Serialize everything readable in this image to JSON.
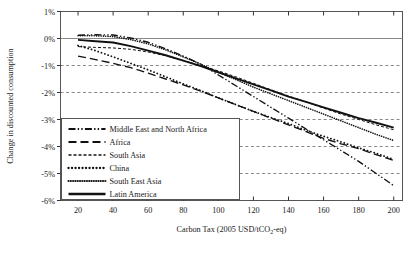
{
  "chart_data": {
    "type": "line",
    "title": "",
    "xlabel": "Carbon Tax (2005 USD/tCO2-eq)",
    "xlabel_parts": {
      "pre": "Carbon Tax (2005 USD/tCO",
      "sub": "2",
      "post": "-eq)"
    },
    "ylabel": "Change in discounted consumption",
    "xlim": [
      10,
      205
    ],
    "ylim": [
      -6,
      1
    ],
    "xticks": [
      20,
      40,
      60,
      80,
      100,
      120,
      140,
      160,
      180,
      200
    ],
    "xtick_labels": [
      "20",
      "40",
      "60",
      "80",
      "100",
      "120",
      "140",
      "160",
      "180",
      "200"
    ],
    "yticks": [
      1,
      0,
      -1,
      -2,
      -3,
      -4,
      -5,
      -6
    ],
    "ytick_labels": [
      "1%",
      "0%",
      "-1%",
      "-2%",
      "-3%",
      "-4%",
      "-5%",
      "-6%"
    ],
    "grid": "horizontal-dashed",
    "legend_position": "lower-left-inside",
    "x": [
      20,
      30,
      40,
      50,
      60,
      70,
      80,
      90,
      100,
      110,
      120,
      130,
      140,
      150,
      160,
      170,
      180,
      190,
      200
    ],
    "series": [
      {
        "name": "Middle East and North Africa",
        "style": "dash-dot-dot",
        "values": [
          0.12,
          0.14,
          0.13,
          0.02,
          -0.14,
          -0.38,
          -0.65,
          -0.95,
          -1.35,
          -1.75,
          -2.15,
          -2.55,
          -2.95,
          -3.35,
          -3.75,
          -4.15,
          -4.55,
          -5.0,
          -5.45
        ]
      },
      {
        "name": "Africa",
        "style": "long-dash",
        "values": [
          -0.65,
          -0.78,
          -0.92,
          -1.08,
          -1.28,
          -1.5,
          -1.72,
          -1.95,
          -2.2,
          -2.45,
          -2.7,
          -2.95,
          -3.2,
          -3.45,
          -3.7,
          -3.9,
          -4.08,
          -4.3,
          -4.52
        ]
      },
      {
        "name": "South Asia",
        "style": "fine-dash",
        "values": [
          -0.3,
          -0.33,
          -0.35,
          -0.4,
          -0.5,
          -0.64,
          -0.82,
          -1.0,
          -1.2,
          -1.42,
          -1.66,
          -1.9,
          -2.13,
          -2.35,
          -2.58,
          -2.8,
          -3.0,
          -3.2,
          -3.38
        ]
      },
      {
        "name": "China",
        "style": "dotted-large",
        "values": [
          -0.26,
          -0.45,
          -0.68,
          -0.92,
          -1.16,
          -1.42,
          -1.68,
          -1.93,
          -2.2,
          -2.45,
          -2.7,
          -2.93,
          -3.15,
          -3.4,
          -3.62,
          -3.83,
          -4.05,
          -4.25,
          -4.48
        ]
      },
      {
        "name": "South East Asia",
        "style": "dotted-dense",
        "values": [
          0.1,
          0.1,
          0.07,
          -0.04,
          -0.2,
          -0.42,
          -0.68,
          -0.95,
          -1.25,
          -1.52,
          -1.8,
          -2.05,
          -2.3,
          -2.55,
          -2.8,
          -3.05,
          -3.3,
          -3.55,
          -3.78
        ]
      },
      {
        "name": "Latin America",
        "style": "solid",
        "values": [
          -0.05,
          -0.1,
          -0.15,
          -0.28,
          -0.45,
          -0.62,
          -0.82,
          -1.02,
          -1.25,
          -1.48,
          -1.7,
          -1.92,
          -2.15,
          -2.35,
          -2.55,
          -2.75,
          -2.95,
          -3.12,
          -3.3
        ]
      }
    ]
  },
  "legend": {
    "items": [
      {
        "label": "Middle East and North Africa"
      },
      {
        "label": "Africa"
      },
      {
        "label": "South Asia"
      },
      {
        "label": "China"
      },
      {
        "label": "South East Asia"
      },
      {
        "label": "Latin America"
      }
    ]
  }
}
